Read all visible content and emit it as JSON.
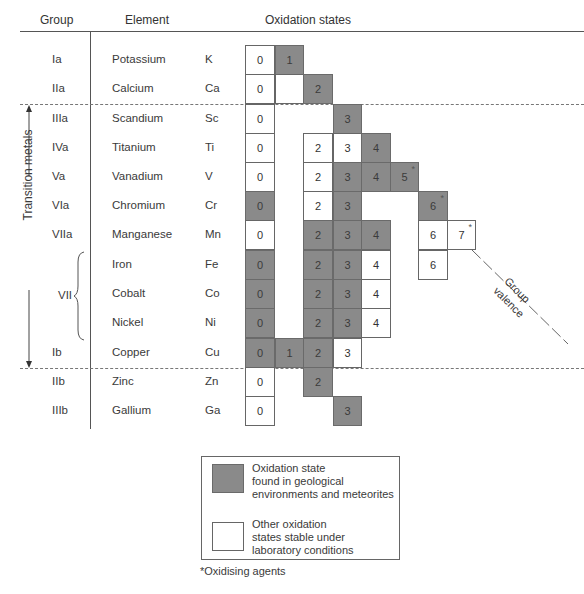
{
  "headers": {
    "group": "Group",
    "element": "Element",
    "oxidation": "Oxidation states"
  },
  "side_label": "Transition metals",
  "brace_group": "VII",
  "valence_label": {
    "line1": "Group",
    "line2": "valence"
  },
  "colors": {
    "geological": "#8a8a8a",
    "laboratory": "#ffffff",
    "border": "#666666"
  },
  "rows": [
    {
      "group": "Ia",
      "name": "Potassium",
      "symbol": "K",
      "states": [
        {
          "v": "0",
          "c": 0,
          "t": "lab"
        },
        {
          "v": "1",
          "c": 1,
          "t": "geo"
        }
      ]
    },
    {
      "group": "IIa",
      "name": "Calcium",
      "symbol": "Ca",
      "states": [
        {
          "v": "0",
          "c": 0,
          "t": "lab"
        },
        {
          "v": "",
          "c": 1,
          "t": "lab"
        },
        {
          "v": "2",
          "c": 2,
          "t": "geo"
        }
      ]
    },
    {
      "group": "IIIa",
      "name": "Scandium",
      "symbol": "Sc",
      "states": [
        {
          "v": "0",
          "c": 0,
          "t": "lab"
        },
        {
          "v": "3",
          "c": 3,
          "t": "geo"
        }
      ]
    },
    {
      "group": "IVa",
      "name": "Titanium",
      "symbol": "Ti",
      "states": [
        {
          "v": "0",
          "c": 0,
          "t": "lab"
        },
        {
          "v": "2",
          "c": 2,
          "t": "lab"
        },
        {
          "v": "3",
          "c": 3,
          "t": "lab"
        },
        {
          "v": "4",
          "c": 4,
          "t": "geo"
        }
      ]
    },
    {
      "group": "Va",
      "name": "Vanadium",
      "symbol": "V",
      "states": [
        {
          "v": "0",
          "c": 0,
          "t": "lab"
        },
        {
          "v": "2",
          "c": 2,
          "t": "lab"
        },
        {
          "v": "3",
          "c": 3,
          "t": "geo"
        },
        {
          "v": "4",
          "c": 4,
          "t": "geo"
        },
        {
          "v": "5",
          "c": 5,
          "t": "geo",
          "ox": true
        }
      ]
    },
    {
      "group": "VIa",
      "name": "Chromium",
      "symbol": "Cr",
      "states": [
        {
          "v": "0",
          "c": 0,
          "t": "geo"
        },
        {
          "v": "2",
          "c": 2,
          "t": "lab"
        },
        {
          "v": "3",
          "c": 3,
          "t": "geo"
        },
        {
          "v": "6",
          "c": 6,
          "t": "geo",
          "ox": true
        }
      ]
    },
    {
      "group": "VIIa",
      "name": "Manganese",
      "symbol": "Mn",
      "states": [
        {
          "v": "0",
          "c": 0,
          "t": "lab"
        },
        {
          "v": "2",
          "c": 2,
          "t": "geo"
        },
        {
          "v": "3",
          "c": 3,
          "t": "geo"
        },
        {
          "v": "4",
          "c": 4,
          "t": "geo"
        },
        {
          "v": "6",
          "c": 6,
          "t": "lab"
        },
        {
          "v": "7",
          "c": 7,
          "t": "lab",
          "ox": true
        }
      ]
    },
    {
      "group": "",
      "name": "Iron",
      "symbol": "Fe",
      "states": [
        {
          "v": "0",
          "c": 0,
          "t": "geo"
        },
        {
          "v": "2",
          "c": 2,
          "t": "geo"
        },
        {
          "v": "3",
          "c": 3,
          "t": "geo"
        },
        {
          "v": "4",
          "c": 4,
          "t": "lab"
        },
        {
          "v": "6",
          "c": 6,
          "t": "lab"
        }
      ]
    },
    {
      "group": "",
      "name": "Cobalt",
      "symbol": "Co",
      "states": [
        {
          "v": "0",
          "c": 0,
          "t": "geo"
        },
        {
          "v": "2",
          "c": 2,
          "t": "geo"
        },
        {
          "v": "3",
          "c": 3,
          "t": "geo"
        },
        {
          "v": "4",
          "c": 4,
          "t": "lab"
        }
      ]
    },
    {
      "group": "",
      "name": "Nickel",
      "symbol": "Ni",
      "states": [
        {
          "v": "0",
          "c": 0,
          "t": "geo"
        },
        {
          "v": "2",
          "c": 2,
          "t": "geo"
        },
        {
          "v": "3",
          "c": 3,
          "t": "geo"
        },
        {
          "v": "4",
          "c": 4,
          "t": "lab"
        }
      ]
    },
    {
      "group": "Ib",
      "name": "Copper",
      "symbol": "Cu",
      "states": [
        {
          "v": "0",
          "c": 0,
          "t": "geo"
        },
        {
          "v": "1",
          "c": 1,
          "t": "geo"
        },
        {
          "v": "2",
          "c": 2,
          "t": "geo"
        },
        {
          "v": "3",
          "c": 3,
          "t": "lab"
        }
      ]
    },
    {
      "group": "IIb",
      "name": "Zinc",
      "symbol": "Zn",
      "states": [
        {
          "v": "0",
          "c": 0,
          "t": "lab"
        },
        {
          "v": "2",
          "c": 2,
          "t": "geo"
        }
      ]
    },
    {
      "group": "IIIb",
      "name": "Gallium",
      "symbol": "Ga",
      "states": [
        {
          "v": "0",
          "c": 0,
          "t": "lab"
        },
        {
          "v": "3",
          "c": 3,
          "t": "geo"
        }
      ]
    }
  ],
  "legend": {
    "geological": {
      "line1": "Oxidation state",
      "line2": "found in geological",
      "line3": "environments and meteorites"
    },
    "laboratory": {
      "line1": "Other oxidation",
      "line2": "states stable under",
      "line3": "laboratory conditions"
    }
  },
  "footnote": "*Oxidising agents"
}
